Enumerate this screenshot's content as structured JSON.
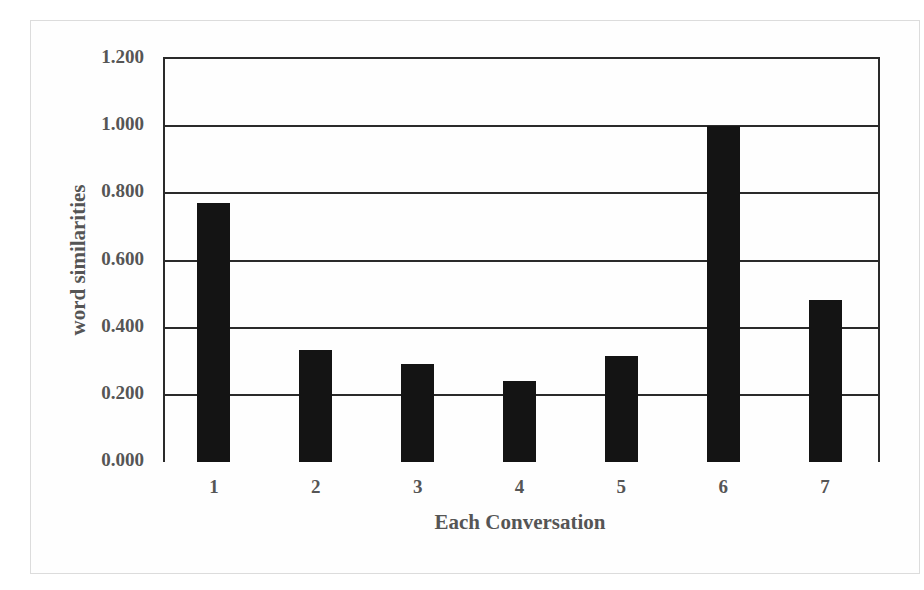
{
  "chart_data": {
    "type": "bar",
    "title": "",
    "xlabel": "Each Conversation",
    "ylabel": "word similarities",
    "categories": [
      "1",
      "2",
      "3",
      "4",
      "5",
      "6",
      "7"
    ],
    "values": [
      0.77,
      0.335,
      0.293,
      0.24,
      0.315,
      1.0,
      0.483
    ],
    "ylim": [
      0,
      1.2
    ],
    "yticks": [
      "0.000",
      "0.200",
      "0.400",
      "0.600",
      "0.800",
      "1.000",
      "1.200"
    ],
    "grid": true,
    "legend": null,
    "bar_color": "#141414"
  }
}
